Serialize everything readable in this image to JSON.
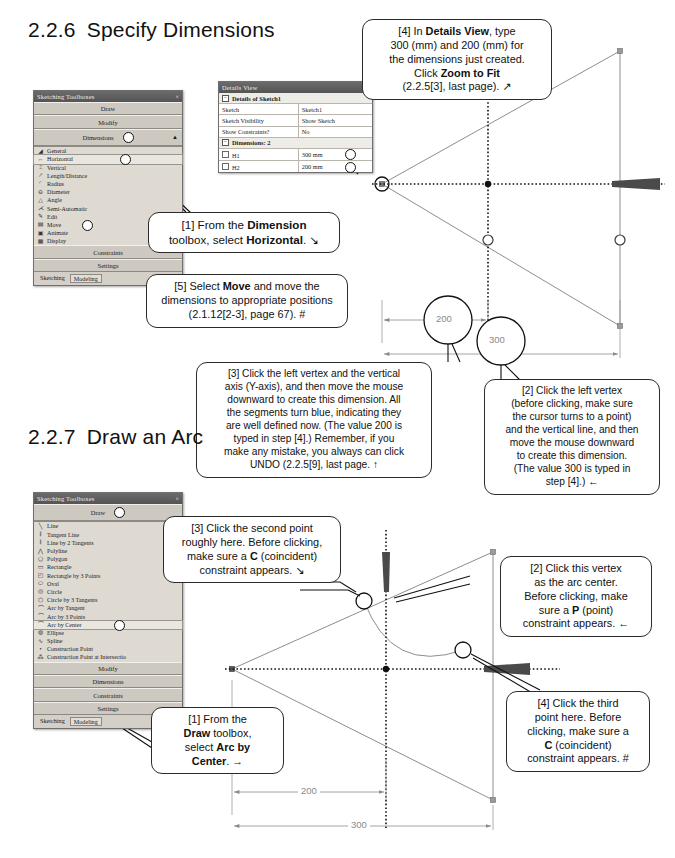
{
  "sections": [
    {
      "num": "2.2.6",
      "title": "Specify Dimensions"
    },
    {
      "num": "2.2.7",
      "title": "Draw an Arc"
    }
  ],
  "sketch_panel_1": {
    "title": "Sketching Toolboxes",
    "close_glyph": "×",
    "bars_top": [
      {
        "label": "Draw"
      },
      {
        "label": "Modify"
      },
      {
        "label": "Dimensions",
        "marker": true,
        "collapse": "▲"
      }
    ],
    "items": [
      {
        "icon": "general-dimension-icon",
        "glyph": "◢",
        "label": "General"
      },
      {
        "icon": "horizontal-dimension-icon",
        "glyph": "↔",
        "label": "Horizontal",
        "selected": true
      },
      {
        "icon": "vertical-dimension-icon",
        "glyph": "⌶",
        "label": "Vertical"
      },
      {
        "icon": "length-distance-icon",
        "glyph": "↗",
        "label": "Length/Distance"
      },
      {
        "icon": "radius-icon",
        "glyph": "◜",
        "label": "Radius"
      },
      {
        "icon": "diameter-icon",
        "glyph": "⊖",
        "label": "Diameter"
      },
      {
        "icon": "angle-icon",
        "glyph": "△",
        "label": "Angle"
      },
      {
        "icon": "semi-automatic-icon",
        "glyph": "⋌",
        "label": "Semi-Automatic"
      },
      {
        "icon": "edit-icon",
        "glyph": "✎",
        "label": "Edit"
      },
      {
        "icon": "move-icon",
        "glyph": "▤",
        "label": "Move"
      },
      {
        "icon": "animate-icon",
        "glyph": "▣",
        "label": "Animate"
      },
      {
        "icon": "display-icon",
        "glyph": "▦",
        "label": "Display"
      }
    ],
    "bars_bottom": [
      {
        "label": "Constraints"
      },
      {
        "label": "Settings"
      }
    ],
    "tabs": [
      {
        "label": "Sketching",
        "active": false
      },
      {
        "label": "Modeling",
        "active": true
      }
    ]
  },
  "details_view": {
    "title": "Details View",
    "pin_glyph": "⇱",
    "group1": "Details of Sketch1",
    "rows": [
      {
        "key": "Sketch",
        "value": "Sketch1"
      },
      {
        "key": "Sketch Visibility",
        "value": "Show Sketch"
      },
      {
        "key": "Show Constraints?",
        "value": "No"
      }
    ],
    "group2": "Dimensions: 2",
    "dimension_rows": [
      {
        "key": "H1",
        "value": "300 mm",
        "marker": true
      },
      {
        "key": "H2",
        "value": "200 mm",
        "marker": true
      }
    ]
  },
  "sketch_panel_2": {
    "title": "Sketching Toolboxes",
    "close_glyph": "×",
    "bars_top": [
      {
        "label": "Draw",
        "marker": true
      }
    ],
    "items": [
      {
        "icon": "line-icon",
        "glyph": "╲",
        "label": "Line"
      },
      {
        "icon": "tangent-line-icon",
        "glyph": "𝄃",
        "label": "Tangent Line"
      },
      {
        "icon": "line-by-2-tangents-icon",
        "glyph": "𝄃",
        "label": "Line by 2 Tangents"
      },
      {
        "icon": "polyline-icon",
        "glyph": "⋀",
        "label": "Polyline"
      },
      {
        "icon": "polygon-icon",
        "glyph": "⬠",
        "label": "Polygon"
      },
      {
        "icon": "rectangle-icon",
        "glyph": "▭",
        "label": "Rectangle"
      },
      {
        "icon": "rectangle-by-3-points-icon",
        "glyph": "◰",
        "label": "Rectangle by 3 Points"
      },
      {
        "icon": "oval-icon",
        "glyph": "⬭",
        "label": "Oval"
      },
      {
        "icon": "circle-icon",
        "glyph": "◎",
        "label": "Circle"
      },
      {
        "icon": "circle-by-3-tangents-icon",
        "glyph": "⬡",
        "label": "Circle by 3 Tangents"
      },
      {
        "icon": "arc-by-tangent-icon",
        "glyph": "⌒",
        "label": "Arc by Tangent"
      },
      {
        "icon": "arc-by-3-points-icon",
        "glyph": "⌒",
        "label": "Arc by 3 Points"
      },
      {
        "icon": "arc-by-center-icon",
        "glyph": "⌒",
        "label": "Arc by Center",
        "selected": true
      },
      {
        "icon": "ellipse-icon",
        "glyph": "◍",
        "label": "Ellipse"
      },
      {
        "icon": "spline-icon",
        "glyph": "∿",
        "label": "Spline"
      },
      {
        "icon": "construction-point-icon",
        "glyph": "•",
        "label": "Construction Point"
      },
      {
        "icon": "construction-point-at-intersection-icon",
        "glyph": "⁂",
        "label": "Construction Point at Intersectio"
      }
    ],
    "bars_bottom": [
      {
        "label": "Modify"
      },
      {
        "label": "Dimensions"
      },
      {
        "label": "Constraints"
      },
      {
        "label": "Settings"
      }
    ],
    "tabs": [
      {
        "label": "Sketching",
        "active": false
      },
      {
        "label": "Modeling",
        "active": true
      }
    ]
  },
  "callouts": {
    "s226_step4": {
      "lines": [
        "[4] In <b>Details View</b>, type",
        "300 (mm) and 200 (mm) for",
        "the dimensions just created.",
        "Click <b>Zoom to Fit</b>",
        "(2.2.5[3], last page). &#x2197;"
      ]
    },
    "s226_step1": {
      "lines": [
        "[1] From the <b>Dimension</b>",
        "toolbox, select <b>Horizontal</b>. &#x2198;"
      ]
    },
    "s226_step5": {
      "lines": [
        "[5] Select <b>Move</b> and move the",
        "dimensions to appropriate positions",
        "(2.1.12[2-3], page 67). #"
      ]
    },
    "s226_step3": {
      "lines": [
        "[3] Click the left vertex and the vertical",
        "axis (Y-axis), and then move the mouse",
        "downward to create this dimension. All",
        "the segments turn blue, indicating they",
        "are well defined now. (The value 200 is",
        "typed in step [4].)  Remember, if you",
        "make any mistake, you always can click",
        "UNDO (2.2.5[9], last page. &#x2191;"
      ]
    },
    "s226_step2": {
      "lines": [
        "[2] Click the left vertex",
        "(before clicking, make sure",
        "the cursor turns to a point)",
        "and the vertical line, and then",
        "move the mouse downward",
        "to create this dimension.",
        "(The value 300 is typed in",
        "step [4].) &#x2190;"
      ]
    },
    "s227_step3": {
      "lines": [
        "[3] Click the second point",
        "roughly here. Before clicking,",
        "make sure a <b>C</b> (coincident)",
        "constraint appears. &#x2198;"
      ]
    },
    "s227_step2": {
      "lines": [
        "[2] Click this vertex",
        "as the arc center.",
        "Before clicking, make",
        "sure a <b>P</b> (point)",
        "constraint appears. &#x2190;"
      ]
    },
    "s227_step1": {
      "lines": [
        "[1] From the",
        "<b>Draw</b> toolbox,",
        "select <b>Arc by</b>",
        "<b>Center</b>. &#x2192;"
      ]
    },
    "s227_step4": {
      "lines": [
        "[4] Click the third",
        "point here. Before",
        "clicking, make sure a",
        "<b>C</b> (coincident)",
        "constraint appears. #"
      ]
    }
  },
  "drawings": {
    "top": {
      "name": "triangle-sketch-with-dimensions",
      "dimensions": [
        {
          "label": "200",
          "name": "dimension-200"
        },
        {
          "label": "300",
          "name": "dimension-300"
        }
      ]
    },
    "bottom": {
      "name": "arc-sketch-with-dimensions",
      "dimensions": [
        {
          "label": "200",
          "name": "dimension-200"
        },
        {
          "label": "300",
          "name": "dimension-300"
        }
      ]
    }
  },
  "colors": {
    "panel_bg": "#d4d0c8",
    "panel_title": "#5a5a5a",
    "sketch_line": "#8a8a8a",
    "dim_text": "#7d7d7d",
    "callout_border": "#2b2b2b"
  }
}
